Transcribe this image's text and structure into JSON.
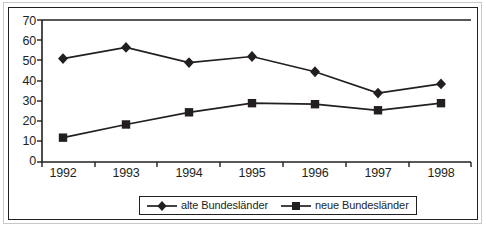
{
  "chart_data": {
    "type": "line",
    "title": "",
    "subtitle": "",
    "xlabel": "",
    "ylabel": "",
    "categories": [
      "1992",
      "1993",
      "1994",
      "1995",
      "1996",
      "1997",
      "1998"
    ],
    "ylim": [
      0,
      70
    ],
    "ytick_labels": [
      "0",
      "10",
      "20",
      "30",
      "40",
      "50",
      "60",
      "70"
    ],
    "ytick_values": [
      0,
      10,
      20,
      30,
      40,
      50,
      60,
      70
    ],
    "grid": false,
    "legend_position": "bottom-center",
    "series": [
      {
        "name": "alte Bundesländer",
        "marker": "diamond",
        "values": [
          51,
          56.5,
          49,
          52,
          44.5,
          34,
          38.5
        ]
      },
      {
        "name": "neue Bundesländer",
        "marker": "square",
        "values": [
          12,
          18.5,
          24.5,
          29,
          28.5,
          25.5,
          29
        ]
      }
    ],
    "colors": {
      "line": "#231f20",
      "axis": "#231f20",
      "background": "#ffffff",
      "frame": "#231f20",
      "outer_frame": "#c8c8c8"
    }
  },
  "legend": {
    "entries": [
      {
        "label": "alte Bundesländer",
        "marker": "diamond"
      },
      {
        "label": "neue Bundesländer",
        "marker": "square"
      }
    ]
  }
}
